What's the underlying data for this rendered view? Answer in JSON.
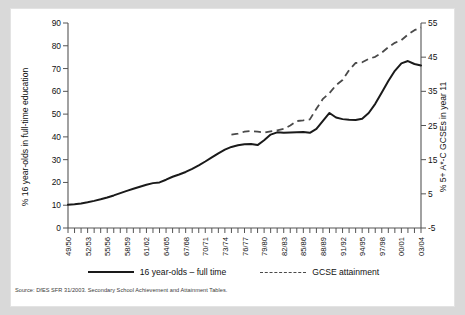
{
  "chart_data": {
    "type": "line",
    "title": "",
    "xlabel": "",
    "ylabel": "% 16 year-olds in full-time education",
    "y2label": "% 5+ A*-C GCSEs in year 11",
    "ylim": [
      0,
      90
    ],
    "y2lim": [
      -5,
      55
    ],
    "yticks": [
      0,
      10,
      20,
      30,
      40,
      50,
      60,
      70,
      80,
      90
    ],
    "y2ticks": [
      -5,
      5,
      15,
      25,
      35,
      45,
      55
    ],
    "grid": false,
    "legend_position": "bottom",
    "x": [
      "49/50",
      "50/51",
      "51/52",
      "52/53",
      "53/54",
      "54/55",
      "55/56",
      "56/57",
      "57/58",
      "58/59",
      "59/60",
      "60/61",
      "61/62",
      "62/63",
      "63/64",
      "64/65",
      "65/66",
      "66/67",
      "67/68",
      "68/69",
      "69/70",
      "70/71",
      "71/72",
      "72/73",
      "73/74",
      "74/75",
      "75/76",
      "76/77",
      "77/78",
      "78/79",
      "79/80",
      "80/81",
      "81/82",
      "82/83",
      "83/84",
      "84/85",
      "85/86",
      "86/87",
      "87/88",
      "88/89",
      "89/90",
      "90/91",
      "91/92",
      "92/93",
      "93/94",
      "94/95",
      "95/96",
      "96/97",
      "97/98",
      "98/99",
      "99/00",
      "00/01",
      "01/02",
      "02/03",
      "03/04"
    ],
    "xtick_labels": [
      "49/50",
      "52/53",
      "55/56",
      "58/59",
      "61/62",
      "64/65",
      "67/68",
      "70/71",
      "73/74",
      "76/77",
      "79/80",
      "82/83",
      "85/86",
      "88/89",
      "91/92",
      "94/95",
      "97/98",
      "00/01",
      "03/04"
    ],
    "xtick_label_every": 3,
    "series": [
      {
        "name": "16 year-olds – full time",
        "axis": "left",
        "style": "solid",
        "color": "#1a1a1a",
        "values": [
          10.2,
          10.4,
          10.8,
          11.3,
          11.9,
          12.6,
          13.4,
          14.3,
          15.3,
          16.3,
          17.2,
          18.1,
          19.0,
          19.7,
          20.0,
          21.2,
          22.5,
          23.5,
          24.6,
          26.0,
          27.5,
          29.2,
          31.0,
          32.8,
          34.4,
          35.6,
          36.3,
          36.8,
          36.9,
          36.4,
          38.5,
          41.0,
          42.0,
          41.8,
          41.9,
          42.0,
          42.1,
          41.8,
          43.5,
          47.0,
          50.5,
          48.5,
          47.8,
          47.5,
          47.4,
          48.0,
          50.5,
          54.5,
          59.5,
          64.5,
          69.0,
          72.3,
          73.3,
          72.0,
          71.3
        ]
      },
      {
        "name": "GCSE attainment",
        "axis": "right",
        "style": "dashed",
        "color": "#4a4a4a",
        "start_index": 25,
        "values": [
          null,
          null,
          null,
          null,
          null,
          null,
          null,
          null,
          null,
          null,
          null,
          null,
          null,
          null,
          null,
          null,
          null,
          null,
          null,
          null,
          null,
          null,
          null,
          null,
          null,
          22.3,
          22.6,
          23.2,
          23.4,
          23.2,
          22.9,
          23.3,
          23.6,
          24.0,
          25.0,
          26.3,
          26.5,
          26.8,
          29.9,
          32.8,
          34.5,
          36.8,
          38.3,
          41.2,
          43.3,
          43.5,
          44.5,
          45.1,
          46.3,
          47.9,
          49.2,
          50.0,
          51.6,
          52.9,
          53.7
        ]
      }
    ]
  },
  "legend": {
    "items": [
      {
        "label": "16 year-olds – full time",
        "style": "solid"
      },
      {
        "label": "GCSE attainment",
        "style": "dashed"
      }
    ]
  },
  "axes": {
    "left_title": "% 16 year-olds in full-time education",
    "right_title": "% 5+ A*-C GCSEs in year 11"
  },
  "source": "Source: DfES SFR 31/2003. Secondary School Achievement and Attainment Tables."
}
